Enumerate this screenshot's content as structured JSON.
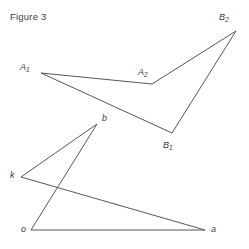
{
  "caption": "Figure 3",
  "style": {
    "background": "#ffffff",
    "stroke": "#444444",
    "stroke_width": 0.9,
    "label_color": "#3a3a3a"
  },
  "points": {
    "A1": {
      "label": "A",
      "sub": "1",
      "x": 41,
      "y": 73,
      "label_x": 20,
      "label_y": 63
    },
    "A2": {
      "label": "A",
      "sub": "2",
      "x": 152,
      "y": 84,
      "label_x": 138,
      "label_y": 68
    },
    "B2": {
      "label": "B",
      "sub": "2",
      "x": 236,
      "y": 31,
      "label_x": 219,
      "label_y": 13
    },
    "B1": {
      "label": "B",
      "sub": "1",
      "x": 172,
      "y": 133,
      "label_x": 163,
      "label_y": 141
    },
    "b": {
      "label": "b",
      "sub": "",
      "x": 97,
      "y": 124,
      "label_x": 102,
      "label_y": 114
    },
    "k": {
      "label": "k",
      "sub": "",
      "x": 21,
      "y": 177,
      "label_x": 10,
      "label_y": 171
    },
    "o": {
      "label": "o",
      "sub": "",
      "x": 31,
      "y": 230,
      "label_x": 21,
      "label_y": 225
    },
    "a": {
      "label": "a",
      "sub": "",
      "x": 205,
      "y": 230,
      "label_x": 211,
      "label_y": 225
    }
  },
  "shapes": [
    {
      "name": "upper-quadrilateral",
      "closed": true,
      "vertices": [
        "A1",
        "A2",
        "B2",
        "B1"
      ]
    },
    {
      "name": "lower-figure-k-b",
      "closed": false,
      "vertices": [
        "k",
        "b"
      ]
    },
    {
      "name": "lower-figure-k-a",
      "closed": false,
      "vertices": [
        "k",
        "a"
      ]
    },
    {
      "name": "lower-figure-o-b",
      "closed": false,
      "vertices": [
        "o",
        "b"
      ]
    },
    {
      "name": "lower-figure-o-a",
      "closed": false,
      "vertices": [
        "o",
        "a"
      ]
    }
  ]
}
